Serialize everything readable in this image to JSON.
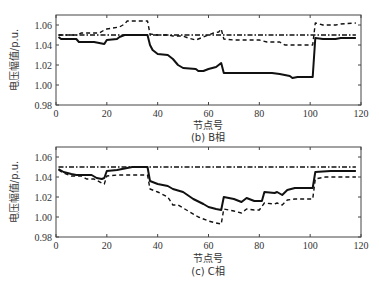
{
  "chart_data": [
    {
      "type": "line",
      "caption": "(b) B相",
      "xlabel": "节点号",
      "ylabel": "电压幅值/p.u.",
      "xlim": [
        0,
        120
      ],
      "ylim": [
        0.98,
        1.07
      ],
      "xticks": [
        0,
        20,
        40,
        60,
        80,
        100,
        120
      ],
      "yticks": [
        0.98,
        1.0,
        1.02,
        1.04,
        1.06
      ],
      "ytick_labels": [
        "0.98",
        "1.00",
        "1.02",
        "1.04",
        "1.06"
      ],
      "grid": false,
      "legend": null,
      "series": [
        {
          "name": "dash-dot (reference)",
          "style": "dashdot",
          "x": [
            1,
            118
          ],
          "y": [
            1.05,
            1.05
          ]
        },
        {
          "name": "solid",
          "style": "solid",
          "x": [
            1,
            2,
            8,
            9,
            15,
            19,
            20,
            24,
            25,
            27,
            36,
            37,
            38,
            40,
            44,
            46,
            48,
            50,
            55,
            56,
            58,
            60,
            63,
            65,
            66,
            85,
            88,
            92,
            93,
            95,
            101,
            102,
            105,
            110,
            112,
            118
          ],
          "y": [
            1.048,
            1.046,
            1.046,
            1.043,
            1.043,
            1.041,
            1.045,
            1.046,
            1.048,
            1.05,
            1.05,
            1.04,
            1.035,
            1.031,
            1.03,
            1.026,
            1.02,
            1.017,
            1.016,
            1.014,
            1.014,
            1.016,
            1.018,
            1.022,
            1.012,
            1.012,
            1.011,
            1.009,
            1.007,
            1.008,
            1.008,
            1.047,
            1.046,
            1.046,
            1.047,
            1.047
          ]
        },
        {
          "name": "dashed",
          "style": "dashed",
          "x": [
            1,
            8,
            10,
            17,
            19,
            20,
            25,
            27,
            28,
            36,
            37,
            40,
            44,
            46,
            50,
            52,
            55,
            58,
            60,
            62,
            64,
            65,
            66,
            70,
            80,
            83,
            88,
            90,
            101,
            102,
            105,
            110,
            112,
            118
          ],
          "y": [
            1.05,
            1.05,
            1.052,
            1.052,
            1.055,
            1.056,
            1.058,
            1.061,
            1.064,
            1.064,
            1.051,
            1.05,
            1.05,
            1.049,
            1.049,
            1.047,
            1.045,
            1.048,
            1.05,
            1.052,
            1.053,
            1.056,
            1.046,
            1.045,
            1.045,
            1.043,
            1.043,
            1.04,
            1.04,
            1.062,
            1.06,
            1.06,
            1.061,
            1.062
          ]
        }
      ]
    },
    {
      "type": "line",
      "caption": "(c) C相",
      "xlabel": "节点号",
      "ylabel": "电压幅值/p.u.",
      "xlim": [
        0,
        120
      ],
      "ylim": [
        0.98,
        1.07
      ],
      "xticks": [
        0,
        20,
        40,
        60,
        80,
        100,
        120
      ],
      "yticks": [
        0.98,
        1.0,
        1.02,
        1.04,
        1.06
      ],
      "ytick_labels": [
        "0.98",
        "1.00",
        "1.02",
        "1.04",
        "1.06"
      ],
      "grid": false,
      "legend": null,
      "series": [
        {
          "name": "dash-dot (reference)",
          "style": "dashdot",
          "x": [
            1,
            118
          ],
          "y": [
            1.05,
            1.05
          ]
        },
        {
          "name": "solid",
          "style": "solid",
          "x": [
            1,
            3,
            6,
            8,
            14,
            16,
            18,
            19,
            20,
            24,
            28,
            30,
            36,
            37,
            40,
            44,
            46,
            50,
            54,
            58,
            60,
            63,
            65,
            66,
            70,
            73,
            75,
            78,
            81,
            82,
            86,
            87,
            89,
            91,
            94,
            101,
            102,
            108,
            118
          ],
          "y": [
            1.048,
            1.045,
            1.043,
            1.042,
            1.042,
            1.039,
            1.038,
            1.039,
            1.046,
            1.047,
            1.049,
            1.05,
            1.05,
            1.036,
            1.033,
            1.031,
            1.028,
            1.025,
            1.018,
            1.013,
            1.01,
            1.008,
            1.007,
            1.02,
            1.018,
            1.015,
            1.019,
            1.016,
            1.016,
            1.025,
            1.024,
            1.025,
            1.022,
            1.027,
            1.029,
            1.029,
            1.045,
            1.046,
            1.046
          ]
        },
        {
          "name": "dashed",
          "style": "dashed",
          "x": [
            1,
            3,
            6,
            10,
            12,
            15,
            18,
            19,
            20,
            24,
            35,
            36,
            37,
            40,
            44,
            46,
            48,
            52,
            56,
            60,
            63,
            65,
            66,
            70,
            73,
            75,
            78,
            80,
            82,
            86,
            87,
            89,
            91,
            94,
            101,
            102,
            106,
            118
          ],
          "y": [
            1.047,
            1.044,
            1.041,
            1.041,
            1.038,
            1.038,
            1.034,
            1.033,
            1.041,
            1.042,
            1.042,
            1.042,
            1.028,
            1.025,
            1.02,
            1.012,
            1.012,
            1.006,
            1.0,
            0.996,
            0.994,
            0.993,
            1.008,
            1.006,
            1.004,
            1.008,
            1.007,
            1.007,
            1.014,
            1.013,
            1.014,
            1.012,
            1.017,
            1.018,
            1.018,
            1.038,
            1.04,
            1.04
          ]
        }
      ]
    }
  ],
  "charts": [
    {
      "caption": "(b) B相",
      "xlabel": "节点号",
      "ylabel": "电压幅值/p.u.",
      "yticks": [
        "1.06",
        "1.04",
        "1.02",
        "1.00",
        "0.98"
      ],
      "xticks": [
        "0",
        "20",
        "40",
        "60",
        "80",
        "100",
        "120"
      ]
    },
    {
      "caption": "(c) C相",
      "xlabel": "节点号",
      "ylabel": "电压幅值/p.u.",
      "yticks": [
        "1.06",
        "1.04",
        "1.02",
        "1.00",
        "0.98"
      ],
      "xticks": [
        "0",
        "20",
        "40",
        "60",
        "80",
        "100",
        "120"
      ]
    }
  ],
  "colors": {
    "line": "#111111",
    "axis": "#444444",
    "text": "#333333"
  }
}
